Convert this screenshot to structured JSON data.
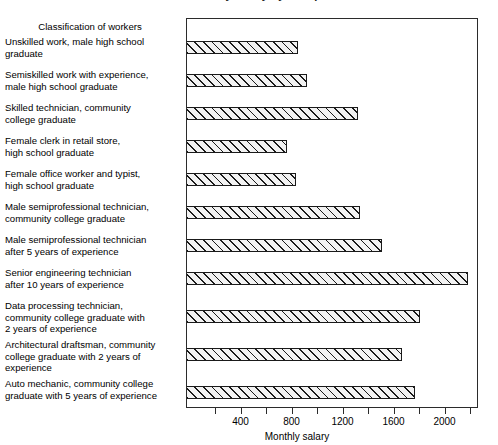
{
  "chart_data": {
    "type": "bar",
    "orientation": "horizontal",
    "title": "",
    "xlabel": "Monthly salary",
    "ylabel": "Classification of workers",
    "categories": [
      "Unskilled work, male high school\ngraduate",
      "Semiskilled work with experience,\nmale high school graduate",
      "Skilled technician, community\ncollege graduate",
      "Female clerk in retail store,\nhigh school graduate",
      "Female office worker and typist,\nhigh school graduate",
      "Male semiprofessional technician,\ncommunity college graduate",
      "Male semiprofessional technician\nafter 5 years of experience",
      "Senior engineering technician\nafter 10 years of experience",
      "Data processing technician,\ncommunity college graduate with\n2 years of experience",
      "Architectural draftsman, community\ncollege graduate with 2 years of\nexperience",
      "Auto mechanic, community college\ngraduate with 5 years of experience"
    ],
    "values": [
      840,
      910,
      1310,
      760,
      830,
      1330,
      1500,
      2180,
      1800,
      1660,
      1760
    ],
    "xlim": [
      0,
      2290
    ],
    "xticks": [
      200,
      400,
      600,
      800,
      1000,
      1200,
      1400,
      1600,
      1800,
      2000,
      2200
    ],
    "xtick_labels": [
      "",
      "400",
      "",
      "800",
      "",
      "1200",
      "",
      "1600",
      "",
      "2000",
      ""
    ],
    "grid": false,
    "legend": false,
    "bar_fill": "#f2f2f2",
    "bar_edge": "#1a1a1a",
    "bar_pattern": "diagonal-hatch"
  },
  "header": {
    "column_header": "Classification of workers",
    "clipped_title": "Estimated monthly salary by occupation"
  },
  "axis": {
    "title": "Monthly salary"
  }
}
